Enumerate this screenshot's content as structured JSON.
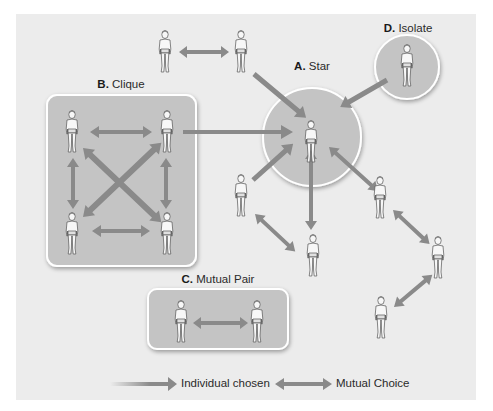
{
  "colors": {
    "panel_bg": "#ececec",
    "group_fill": "#c4c4c4",
    "group_border": "#ffffff",
    "arrow": "#8a8a8a",
    "figure_stroke": "#555555",
    "figure_fill": "#f7f7f7"
  },
  "groups": {
    "star": {
      "letter": "A.",
      "name": "Star"
    },
    "clique": {
      "letter": "B.",
      "name": "Clique"
    },
    "mutual_pair": {
      "letter": "C.",
      "name": "Mutual Pair"
    },
    "isolate": {
      "letter": "D.",
      "name": "Isolate"
    }
  },
  "legend": {
    "individual_chosen": "Individual chosen",
    "mutual_choice": "Mutual Choice"
  },
  "figures": [
    {
      "id": "top-left",
      "x": 165,
      "y": 30
    },
    {
      "id": "top-right",
      "x": 241,
      "y": 30
    },
    {
      "id": "star",
      "x": 311,
      "y": 120
    },
    {
      "id": "isolate",
      "x": 407,
      "y": 44
    },
    {
      "id": "clique-tl",
      "x": 72,
      "y": 110
    },
    {
      "id": "clique-tr",
      "x": 167,
      "y": 110
    },
    {
      "id": "clique-bl",
      "x": 72,
      "y": 212
    },
    {
      "id": "clique-br",
      "x": 167,
      "y": 212
    },
    {
      "id": "mid-left",
      "x": 241,
      "y": 174
    },
    {
      "id": "bottom-center",
      "x": 313,
      "y": 234
    },
    {
      "id": "right-upper",
      "x": 380,
      "y": 176
    },
    {
      "id": "right-far",
      "x": 438,
      "y": 236
    },
    {
      "id": "right-lower",
      "x": 381,
      "y": 296
    },
    {
      "id": "pair-left",
      "x": 181,
      "y": 300
    },
    {
      "id": "pair-right",
      "x": 257,
      "y": 300
    }
  ]
}
